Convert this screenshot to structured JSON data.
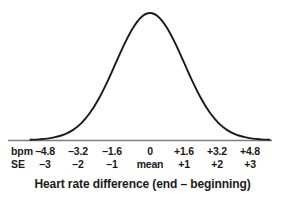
{
  "chart_data": {
    "type": "line",
    "title": "",
    "subtitle": "",
    "xlabel": "Heart rate difference (end – beginning)",
    "ylabel": "",
    "grid": false,
    "legend": "none",
    "distribution": "normal",
    "mean_bpm": 0,
    "sd_bpm": 1.6,
    "xlim": [
      -5.6,
      5.6
    ],
    "ylim": [
      0,
      1
    ],
    "axes_rows": [
      {
        "name": "bpm",
        "label": "bpm",
        "values": [
          "–4.8",
          "–3.2",
          "–1.6",
          "0",
          "+1.6",
          "+3.2",
          "+4.8"
        ]
      },
      {
        "name": "SE",
        "label": "SE",
        "values": [
          "–3",
          "–2",
          "–1",
          "mean",
          "+1",
          "+2",
          "+3"
        ]
      }
    ],
    "tick_positions_px": [
      45,
      78,
      112,
      150,
      184,
      217,
      250
    ],
    "x": [
      -5.6,
      -5.2,
      -4.8,
      -4.4,
      -4.0,
      -3.6,
      -3.2,
      -2.8,
      -2.4,
      -2.0,
      -1.6,
      -1.2,
      -0.8,
      -0.4,
      0,
      0.4,
      0.8,
      1.2,
      1.6,
      2.0,
      2.4,
      2.8,
      3.2,
      3.6,
      4.0,
      4.4,
      4.8,
      5.2,
      5.6
    ],
    "y": [
      0.002,
      0.005,
      0.011,
      0.024,
      0.044,
      0.08,
      0.135,
      0.216,
      0.325,
      0.458,
      0.607,
      0.755,
      0.882,
      0.969,
      1.0,
      0.969,
      0.882,
      0.755,
      0.607,
      0.458,
      0.325,
      0.216,
      0.135,
      0.08,
      0.044,
      0.024,
      0.011,
      0.005,
      0.002
    ],
    "colors": {
      "curve": "#1a1a1a",
      "axis": "#7d7d7d",
      "text": "#1a1a1a",
      "background": "#ffffff"
    }
  },
  "caption": {
    "text": "Heart rate difference (end – beginning)"
  }
}
